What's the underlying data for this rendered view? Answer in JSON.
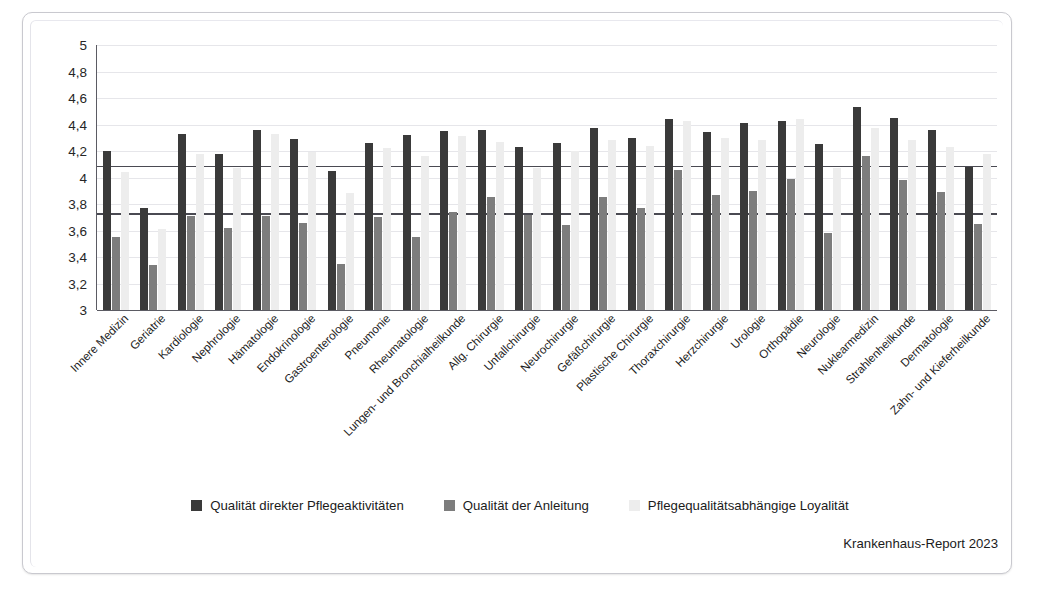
{
  "chart_data": {
    "type": "bar",
    "title": "",
    "subtitle": "",
    "xlabel": "",
    "ylabel": "",
    "ylim": [
      3,
      5
    ],
    "ytick_labels": [
      "3",
      "3,2",
      "3,4",
      "3,6",
      "3,8",
      "4",
      "4,2",
      "4,4",
      "4,6",
      "4,8",
      "5"
    ],
    "ytick_values": [
      3,
      3.2,
      3.4,
      3.6,
      3.8,
      4.0,
      4.2,
      4.4,
      4.6,
      4.8,
      5.0
    ],
    "grid": true,
    "legend_position": "bottom-center",
    "reference_lines": [
      {
        "value": 4.09,
        "label": ""
      },
      {
        "value": 3.73,
        "label": ""
      }
    ],
    "colors": {
      "series1": "#3a3a3a",
      "series2": "#7d7d7d",
      "series3": "#ededed",
      "gridline": "#e6e6ea",
      "axis": "#5b5b63",
      "reference_line": "#4a4a52"
    },
    "categories": [
      "Innere Medizin",
      "Geriatrie",
      "Kardiologie",
      "Nephrologie",
      "Hämatologie",
      "Endokrinologie",
      "Gastroenterologie",
      "Pneumonie",
      "Rheumatologie",
      "Lungen- und Bronchialheilkunde",
      "Allg. Chirurgie",
      "Unfallchirurgie",
      "Neurochirurgie",
      "Gefäßchirurgie",
      "Plastische Chirurgie",
      "Thoraxchirurgie",
      "Herzchirurgie",
      "Urologie",
      "Orthopädie",
      "Neurologie",
      "Nuklearmedizin",
      "Strahlenheilkunde",
      "Dermatologie",
      "Zahn- und Kieferheilkunde"
    ],
    "series": [
      {
        "name": "Qualität direkter Pflegeaktivitäten",
        "color": "#3a3a3a",
        "values": [
          4.2,
          3.77,
          4.33,
          4.18,
          4.36,
          4.29,
          4.05,
          4.26,
          4.32,
          4.35,
          4.36,
          4.23,
          4.26,
          4.37,
          4.3,
          4.44,
          4.34,
          4.41,
          4.43,
          4.25,
          4.53,
          4.45,
          4.36,
          4.08
        ]
      },
      {
        "name": "Qualität der Anleitung",
        "color": "#7d7d7d",
        "values": [
          3.55,
          3.34,
          3.71,
          3.62,
          3.71,
          3.66,
          3.35,
          3.7,
          3.55,
          3.74,
          3.85,
          3.72,
          3.64,
          3.85,
          3.77,
          4.06,
          3.87,
          3.9,
          3.99,
          3.58,
          4.16,
          3.98,
          3.89,
          3.65
        ]
      },
      {
        "name": "Pflegequalitätsabhängige Loyalität",
        "color": "#ededed",
        "values": [
          4.04,
          3.61,
          4.18,
          4.07,
          4.33,
          4.19,
          3.88,
          4.22,
          4.16,
          4.31,
          4.27,
          4.07,
          4.2,
          4.28,
          4.24,
          4.43,
          4.3,
          4.28,
          4.44,
          4.07,
          4.37,
          4.28,
          4.23,
          4.18
        ]
      }
    ]
  },
  "legend": {
    "items": [
      {
        "label": "Qualität direkter Pflegeaktivitäten",
        "color": "#3a3a3a"
      },
      {
        "label": "Qualität der Anleitung",
        "color": "#7d7d7d"
      },
      {
        "label": "Pflegequalitätsabhängige Loyalität",
        "color": "#ededed"
      }
    ]
  },
  "source": {
    "text": "Krankenhaus-Report 2023"
  }
}
